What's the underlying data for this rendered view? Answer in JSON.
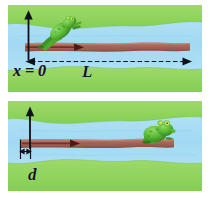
{
  "figure": {
    "background_color": "#ffffff",
    "panel_count": 2
  },
  "colors": {
    "water": "#a9ddf5",
    "water_deep": "#8fd2f0",
    "grass": "#8fd45c",
    "grass_light": "#a8dd74",
    "log": "#a9695a",
    "log_light": "#c08677",
    "log_dark": "#8d5244",
    "frog_body": "#5fbb3a",
    "frog_dark": "#3c8f26",
    "frog_eye": "#f2e55c",
    "axis": "#101018",
    "arrow": "#7a2f22",
    "label_text": "#15151c"
  },
  "panels": [
    {
      "id": "panel-top",
      "name": "frog-launching-panel",
      "caption": "Frog pushes off the left end of the log",
      "frog": {
        "name": "frog-jumping",
        "pose": "leaping",
        "position": "left-end-of-log",
        "direction": "up-right"
      },
      "log": {
        "name": "floating-log",
        "left_x": 0,
        "orientation": "horizontal"
      },
      "axis": {
        "name": "vertical-axis-arrow",
        "direction": "up",
        "origin_label": "x = 0"
      },
      "log_arrow": {
        "name": "log-recoil-arrow",
        "direction": "right"
      },
      "dimension": {
        "name": "length-dimension-L",
        "label": "L",
        "style": "dashed-double-arrow",
        "spans": "from x = 0 to right end of log"
      },
      "labels": [
        {
          "name": "origin-label",
          "text": "x = 0"
        },
        {
          "name": "length-label",
          "text": "L"
        }
      ]
    },
    {
      "id": "panel-bottom",
      "name": "frog-landed-panel",
      "caption": "Frog has landed on the right end; the log has shifted left by d",
      "frog": {
        "name": "frog-sitting",
        "pose": "sitting",
        "position": "right-end-of-log",
        "direction": "right"
      },
      "log": {
        "name": "floating-log",
        "left_x": "shifted",
        "orientation": "horizontal"
      },
      "axis": {
        "name": "vertical-axis-arrow",
        "direction": "up"
      },
      "log_arrow": {
        "name": "log-displacement-arrow",
        "direction": "right"
      },
      "dimension": {
        "name": "displacement-dimension-d",
        "label": "d",
        "style": "double-arrow-with-ticks",
        "spans": "log displacement"
      },
      "labels": [
        {
          "name": "displacement-label",
          "text": "d"
        }
      ]
    }
  ],
  "labels": {
    "origin": "x = 0",
    "length": "L",
    "displacement": "d"
  }
}
